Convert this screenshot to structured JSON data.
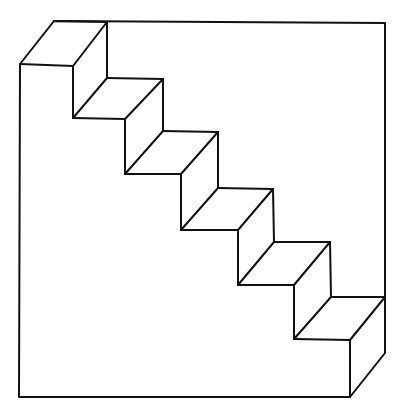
{
  "diagram": {
    "title": "",
    "stroke_color": "#111111",
    "background_color": "#ffffff",
    "outline": [
      [
        20,
        64
      ],
      [
        54,
        21
      ],
      [
        385,
        23
      ],
      [
        385,
        353
      ],
      [
        350,
        397
      ],
      [
        19,
        397
      ],
      [
        20,
        64
      ]
    ],
    "segments": [
      [
        [
          20,
          64
        ],
        [
          73,
          66
        ]
      ],
      [
        [
          54,
          21
        ],
        [
          107,
          22
        ]
      ],
      [
        [
          73,
          66
        ],
        [
          107,
          22
        ]
      ],
      [
        [
          107,
          22
        ],
        [
          107,
          78
        ]
      ],
      [
        [
          73,
          66
        ],
        [
          73,
          118
        ]
      ],
      [
        [
          73,
          118
        ],
        [
          107,
          78
        ]
      ],
      [
        [
          107,
          78
        ],
        [
          163,
          79
        ]
      ],
      [
        [
          73,
          118
        ],
        [
          125,
          119
        ]
      ],
      [
        [
          125,
          119
        ],
        [
          163,
          79
        ]
      ],
      [
        [
          163,
          79
        ],
        [
          163,
          131
        ]
      ],
      [
        [
          125,
          119
        ],
        [
          125,
          174
        ]
      ],
      [
        [
          125,
          174
        ],
        [
          163,
          131
        ]
      ],
      [
        [
          163,
          131
        ],
        [
          218,
          132
        ]
      ],
      [
        [
          125,
          174
        ],
        [
          181,
          174
        ]
      ],
      [
        [
          181,
          174
        ],
        [
          218,
          132
        ]
      ],
      [
        [
          218,
          132
        ],
        [
          218,
          188
        ]
      ],
      [
        [
          181,
          174
        ],
        [
          181,
          230
        ]
      ],
      [
        [
          181,
          230
        ],
        [
          218,
          188
        ]
      ],
      [
        [
          218,
          188
        ],
        [
          273,
          189
        ]
      ],
      [
        [
          181,
          230
        ],
        [
          238,
          230
        ]
      ],
      [
        [
          238,
          230
        ],
        [
          273,
          189
        ]
      ],
      [
        [
          273,
          189
        ],
        [
          274,
          242
        ]
      ],
      [
        [
          238,
          230
        ],
        [
          238,
          285
        ]
      ],
      [
        [
          238,
          285
        ],
        [
          274,
          242
        ]
      ],
      [
        [
          274,
          242
        ],
        [
          330,
          242
        ]
      ],
      [
        [
          238,
          285
        ],
        [
          294,
          285
        ]
      ],
      [
        [
          294,
          285
        ],
        [
          330,
          242
        ]
      ],
      [
        [
          330,
          242
        ],
        [
          331,
          297
        ]
      ],
      [
        [
          294,
          285
        ],
        [
          294,
          339
        ]
      ],
      [
        [
          294,
          339
        ],
        [
          331,
          297
        ]
      ],
      [
        [
          331,
          297
        ],
        [
          385,
          297
        ]
      ],
      [
        [
          294,
          339
        ],
        [
          350,
          340
        ]
      ],
      [
        [
          350,
          340
        ],
        [
          385,
          297
        ]
      ],
      [
        [
          350,
          340
        ],
        [
          350,
          397
        ]
      ]
    ]
  }
}
